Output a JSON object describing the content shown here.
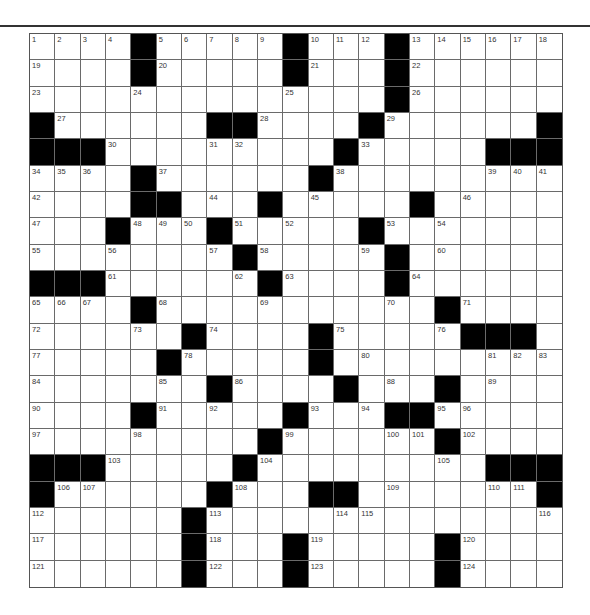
{
  "puzzle": {
    "rows": 21,
    "cols": 21,
    "layout": [
      "....#.....#...#......",
      "....#.....#...#......",
      "..............#......",
      "#......##....#......#",
      "###.........#.....###",
      "....#......#.........",
      "....##...#.....#.....",
      "...#...#.....#.......",
      "........#.....#......",
      "###......#....#......",
      "....#...........#....",
      "......#....#.....###.",
      ".....#.....#.........",
      ".......#....#...#....",
      "....#.....#...##.....",
      ".........#......#....",
      "###.....#.........###",
      "#......#...##.......#",
      "......#..............",
      "......#...#.....#....",
      "......#...#.....#...."
    ],
    "numbers": [
      [
        0,
        0,
        1
      ],
      [
        0,
        1,
        2
      ],
      [
        0,
        2,
        3
      ],
      [
        0,
        3,
        4
      ],
      [
        0,
        5,
        5
      ],
      [
        0,
        6,
        6
      ],
      [
        0,
        7,
        7
      ],
      [
        0,
        8,
        8
      ],
      [
        0,
        9,
        9
      ],
      [
        0,
        11,
        10
      ],
      [
        0,
        12,
        11
      ],
      [
        0,
        13,
        12
      ],
      [
        0,
        15,
        13
      ],
      [
        0,
        16,
        14
      ],
      [
        0,
        17,
        15
      ],
      [
        0,
        18,
        16
      ],
      [
        0,
        19,
        17
      ],
      [
        0,
        20,
        18
      ],
      [
        1,
        0,
        19
      ],
      [
        1,
        5,
        20
      ],
      [
        1,
        11,
        21
      ],
      [
        1,
        15,
        22
      ],
      [
        2,
        0,
        23
      ],
      [
        2,
        4,
        24
      ],
      [
        2,
        10,
        25
      ],
      [
        2,
        15,
        26
      ],
      [
        3,
        1,
        27
      ],
      [
        3,
        9,
        28
      ],
      [
        3,
        14,
        29
      ],
      [
        4,
        3,
        30
      ],
      [
        4,
        7,
        31
      ],
      [
        4,
        8,
        32
      ],
      [
        4,
        13,
        33
      ],
      [
        5,
        0,
        34
      ],
      [
        5,
        1,
        35
      ],
      [
        5,
        2,
        36
      ],
      [
        5,
        5,
        37
      ],
      [
        5,
        12,
        38
      ],
      [
        5,
        18,
        39
      ],
      [
        5,
        19,
        40
      ],
      [
        5,
        20,
        41
      ],
      [
        6,
        0,
        42
      ],
      [
        6,
        4,
        43
      ],
      [
        6,
        7,
        44
      ],
      [
        6,
        11,
        45
      ],
      [
        6,
        17,
        46
      ],
      [
        7,
        0,
        47
      ],
      [
        7,
        4,
        48
      ],
      [
        7,
        5,
        49
      ],
      [
        7,
        6,
        50
      ],
      [
        7,
        8,
        51
      ],
      [
        7,
        10,
        52
      ],
      [
        7,
        14,
        53
      ],
      [
        7,
        16,
        54
      ],
      [
        8,
        0,
        55
      ],
      [
        8,
        3,
        56
      ],
      [
        8,
        7,
        57
      ],
      [
        8,
        9,
        58
      ],
      [
        8,
        13,
        59
      ],
      [
        8,
        16,
        60
      ],
      [
        9,
        3,
        61
      ],
      [
        9,
        8,
        62
      ],
      [
        9,
        10,
        63
      ],
      [
        9,
        15,
        64
      ],
      [
        10,
        0,
        65
      ],
      [
        10,
        1,
        66
      ],
      [
        10,
        2,
        67
      ],
      [
        10,
        5,
        68
      ],
      [
        10,
        9,
        69
      ],
      [
        10,
        14,
        70
      ],
      [
        10,
        17,
        71
      ],
      [
        11,
        0,
        72
      ],
      [
        11,
        4,
        73
      ],
      [
        11,
        7,
        74
      ],
      [
        11,
        12,
        75
      ],
      [
        11,
        16,
        76
      ],
      [
        12,
        0,
        77
      ],
      [
        12,
        6,
        78
      ],
      [
        12,
        11,
        79
      ],
      [
        12,
        13,
        80
      ],
      [
        12,
        18,
        81
      ],
      [
        12,
        19,
        82
      ],
      [
        12,
        20,
        83
      ],
      [
        13,
        0,
        84
      ],
      [
        13,
        5,
        85
      ],
      [
        13,
        8,
        86
      ],
      [
        13,
        12,
        87
      ],
      [
        13,
        14,
        88
      ],
      [
        13,
        18,
        89
      ],
      [
        14,
        0,
        90
      ],
      [
        14,
        5,
        91
      ],
      [
        14,
        7,
        92
      ],
      [
        14,
        11,
        93
      ],
      [
        14,
        13,
        94
      ],
      [
        14,
        16,
        95
      ],
      [
        14,
        17,
        96
      ],
      [
        15,
        0,
        97
      ],
      [
        15,
        4,
        98
      ],
      [
        15,
        10,
        99
      ],
      [
        15,
        14,
        100
      ],
      [
        15,
        15,
        101
      ],
      [
        15,
        17,
        102
      ],
      [
        16,
        3,
        103
      ],
      [
        16,
        9,
        104
      ],
      [
        16,
        16,
        105
      ],
      [
        17,
        1,
        106
      ],
      [
        17,
        2,
        107
      ],
      [
        17,
        8,
        108
      ],
      [
        17,
        14,
        109
      ],
      [
        17,
        18,
        110
      ],
      [
        17,
        19,
        111
      ],
      [
        18,
        0,
        112
      ],
      [
        18,
        7,
        113
      ],
      [
        18,
        12,
        114
      ],
      [
        18,
        13,
        115
      ],
      [
        18,
        20,
        116
      ],
      [
        19,
        0,
        117
      ],
      [
        19,
        7,
        118
      ],
      [
        19,
        11,
        119
      ],
      [
        19,
        17,
        120
      ],
      [
        20,
        0,
        121
      ],
      [
        20,
        7,
        122
      ],
      [
        20,
        11,
        123
      ],
      [
        20,
        17,
        124
      ]
    ]
  },
  "colors": {
    "block": "#000000",
    "cell": "#ffffff",
    "line": "#6a6a6a",
    "number": "#333333",
    "rule": "#333333"
  }
}
